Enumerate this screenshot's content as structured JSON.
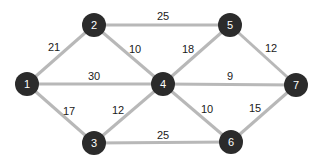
{
  "diagram": {
    "type": "weighted-undirected-graph",
    "colors": {
      "background": "#ffffff",
      "edge": "#b8b8b8",
      "node_fill": "#2b2b2b",
      "node_text": "#ffffff",
      "weight_text": "#1a1a1a"
    },
    "nodes": [
      {
        "id": "1",
        "label": "1",
        "x": 27,
        "y": 84
      },
      {
        "id": "2",
        "label": "2",
        "x": 94,
        "y": 25
      },
      {
        "id": "3",
        "label": "3",
        "x": 94,
        "y": 143
      },
      {
        "id": "4",
        "label": "4",
        "x": 163,
        "y": 84
      },
      {
        "id": "5",
        "label": "5",
        "x": 230,
        "y": 25
      },
      {
        "id": "6",
        "label": "6",
        "x": 231,
        "y": 142
      },
      {
        "id": "7",
        "label": "7",
        "x": 296,
        "y": 85
      }
    ],
    "edges": [
      {
        "from": "1",
        "to": "2",
        "weight": "21",
        "lx": 54,
        "ly": 47
      },
      {
        "from": "1",
        "to": "4",
        "weight": "30",
        "lx": 94,
        "ly": 76
      },
      {
        "from": "1",
        "to": "3",
        "weight": "17",
        "lx": 69,
        "ly": 111
      },
      {
        "from": "2",
        "to": "5",
        "weight": "25",
        "lx": 163,
        "ly": 16
      },
      {
        "from": "2",
        "to": "4",
        "weight": "10",
        "lx": 135,
        "ly": 49
      },
      {
        "from": "3",
        "to": "4",
        "weight": "12",
        "lx": 118,
        "ly": 110
      },
      {
        "from": "3",
        "to": "6",
        "weight": "25",
        "lx": 163,
        "ly": 135
      },
      {
        "from": "4",
        "to": "5",
        "weight": "18",
        "lx": 188,
        "ly": 49
      },
      {
        "from": "4",
        "to": "7",
        "weight": "9",
        "lx": 230,
        "ly": 76
      },
      {
        "from": "4",
        "to": "6",
        "weight": "10",
        "lx": 207,
        "ly": 109
      },
      {
        "from": "5",
        "to": "7",
        "weight": "12",
        "lx": 271,
        "ly": 48
      },
      {
        "from": "6",
        "to": "7",
        "weight": "15",
        "lx": 255,
        "ly": 108
      }
    ]
  }
}
